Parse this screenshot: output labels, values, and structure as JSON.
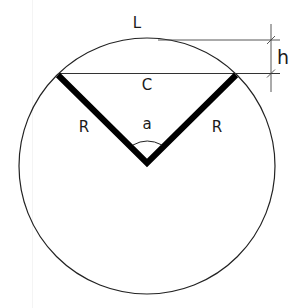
{
  "diagram": {
    "type": "circular-segment-geometry",
    "labels": {
      "arc_length": "L",
      "height": "h",
      "chord": "C",
      "radius_left": "R",
      "radius_right": "R",
      "angle": "a"
    },
    "colors": {
      "stroke": "#222222",
      "thick_stroke": "#000000",
      "background": "#ffffff"
    }
  }
}
